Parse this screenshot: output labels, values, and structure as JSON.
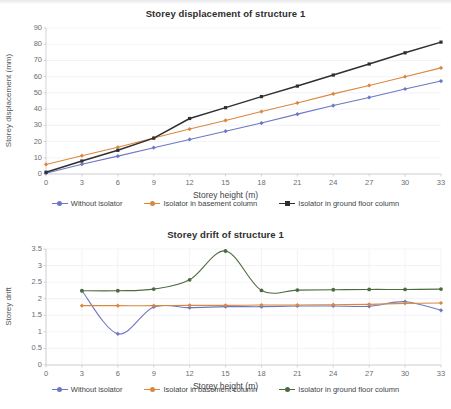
{
  "document": {
    "kind": "scanned-figure-page",
    "background_color": "#ffffff"
  },
  "series_colors": {
    "without_isolator": "#6d77c4",
    "isolator_basement": "#d9883f",
    "isolator_ground_displacement": "#2f2f2f",
    "isolator_ground_drift": "#4d6b41"
  },
  "chart_data": [
    {
      "id": "storey-displacement",
      "type": "line",
      "title": "Storey displacement of structure 1",
      "xlabel": "Storey height (m)",
      "ylabel": "Storey displacement (mm)",
      "x": [
        0,
        3,
        6,
        9,
        12,
        15,
        18,
        21,
        24,
        27,
        30,
        33
      ],
      "xlim": [
        0,
        33
      ],
      "ylim": [
        0,
        90
      ],
      "xticks": [
        "0",
        "3",
        "6",
        "9",
        "12",
        "15",
        "18",
        "21",
        "24",
        "27",
        "30",
        "33"
      ],
      "yticks": [
        "0",
        "10",
        "20",
        "30",
        "40",
        "50",
        "60",
        "70",
        "80",
        "90"
      ],
      "grid": "horizontal-faint",
      "legend_position": "bottom",
      "series": [
        {
          "name": "Without isolator",
          "color": "#6d77c4",
          "marker": "diamond",
          "values": [
            0.5,
            6.0,
            11.0,
            16.2,
            21.3,
            26.4,
            31.4,
            36.9,
            42.2,
            47.2,
            52.4,
            57.3
          ]
        },
        {
          "name": "Isolator in basement column",
          "color": "#d9883f",
          "marker": "diamond",
          "values": [
            5.9,
            11.3,
            16.5,
            22.2,
            27.7,
            33.0,
            38.5,
            43.8,
            49.4,
            54.6,
            60.0,
            65.4
          ]
        },
        {
          "name": "Isolator in ground floor column",
          "color": "#2f2f2f",
          "marker": "square",
          "values": [
            1.1,
            8.0,
            14.6,
            22.1,
            34.2,
            40.9,
            47.7,
            54.2,
            61.0,
            67.8,
            74.7,
            81.3
          ]
        }
      ]
    },
    {
      "id": "storey-drift",
      "type": "line",
      "title": "Storey drift of structure 1",
      "xlabel": "Storey height (m)",
      "ylabel": "Storey drift",
      "x": [
        3,
        6,
        9,
        12,
        15,
        18,
        21,
        24,
        27,
        30,
        33
      ],
      "xlim": [
        0,
        33
      ],
      "ylim": [
        0,
        3.5
      ],
      "xticks": [
        "0",
        "3",
        "6",
        "9",
        "12",
        "15",
        "18",
        "21",
        "24",
        "27",
        "30",
        "33"
      ],
      "yticks": [
        "0",
        "0.5",
        "1",
        "1.5",
        "2",
        "2.5",
        "3",
        "3.5"
      ],
      "grid": "vertical-faint",
      "smoothing": "spline",
      "legend_position": "bottom",
      "series": [
        {
          "name": "Without isolator",
          "color": "#6d77c4",
          "marker": "diamond",
          "values": [
            2.24,
            0.94,
            1.75,
            1.73,
            1.76,
            1.76,
            1.78,
            1.78,
            1.77,
            1.91,
            1.65
          ]
        },
        {
          "name": "Isolator in basement column",
          "color": "#d9883f",
          "marker": "diamond",
          "values": [
            1.79,
            1.79,
            1.79,
            1.8,
            1.8,
            1.81,
            1.81,
            1.82,
            1.83,
            1.86,
            1.87
          ]
        },
        {
          "name": "Isolator in ground floor column",
          "color": "#4d6b41",
          "marker": "circle",
          "values": [
            2.24,
            2.24,
            2.29,
            2.57,
            3.44,
            2.25,
            2.26,
            2.27,
            2.28,
            2.28,
            2.29
          ]
        }
      ]
    }
  ],
  "charts": {
    "displacement": {
      "title": "Storey displacement of structure 1",
      "xlabel": "Storey height (m)",
      "ylabel": "Storey displacement (mm)",
      "legend": [
        "Without isolator",
        "Isolator in basement column",
        "Isolator in ground floor column"
      ]
    },
    "drift": {
      "title": "Storey drift of structure 1",
      "xlabel": "Storey height (m)",
      "ylabel": "Storey drift",
      "legend": [
        "Without isolator",
        "Isolator in basement column",
        "Isolator in ground floor column"
      ]
    }
  }
}
